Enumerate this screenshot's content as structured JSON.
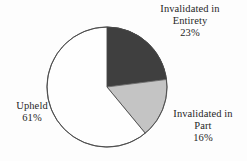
{
  "chart_data": {
    "type": "pie",
    "title": "",
    "subtitle": "",
    "xlabel": "",
    "ylabel": "",
    "legend_position": "none",
    "grid": false,
    "start_angle_deg": 0,
    "direction": "clockwise",
    "categories": [
      "Invalidated in Entirety",
      "Invalidated in Part",
      "Upheld"
    ],
    "values": [
      23,
      16,
      61
    ],
    "value_unit": "%",
    "slices": [
      {
        "label": "Invalidated in Entirety",
        "label_line1": "Invalidated in",
        "label_line2": "Entirety",
        "value": 23,
        "value_text": "23%",
        "color": "#3f3f3f",
        "stroke": "#3a3a3a"
      },
      {
        "label": "Invalidated in Part",
        "label_line1": "Invalidated in",
        "label_line2": "Part",
        "value": 16,
        "value_text": "16%",
        "color": "#c4c4c4",
        "stroke": "#6e6e6e"
      },
      {
        "label": "Upheld",
        "label_line1": "Upheld",
        "label_line2": "",
        "value": 61,
        "value_text": "61%",
        "color": "#fefefe",
        "stroke": "#4a4a4a"
      }
    ]
  },
  "figure": {
    "background": "#fdfdfd",
    "center_x": 107,
    "center_y": 87,
    "radius": 60
  }
}
